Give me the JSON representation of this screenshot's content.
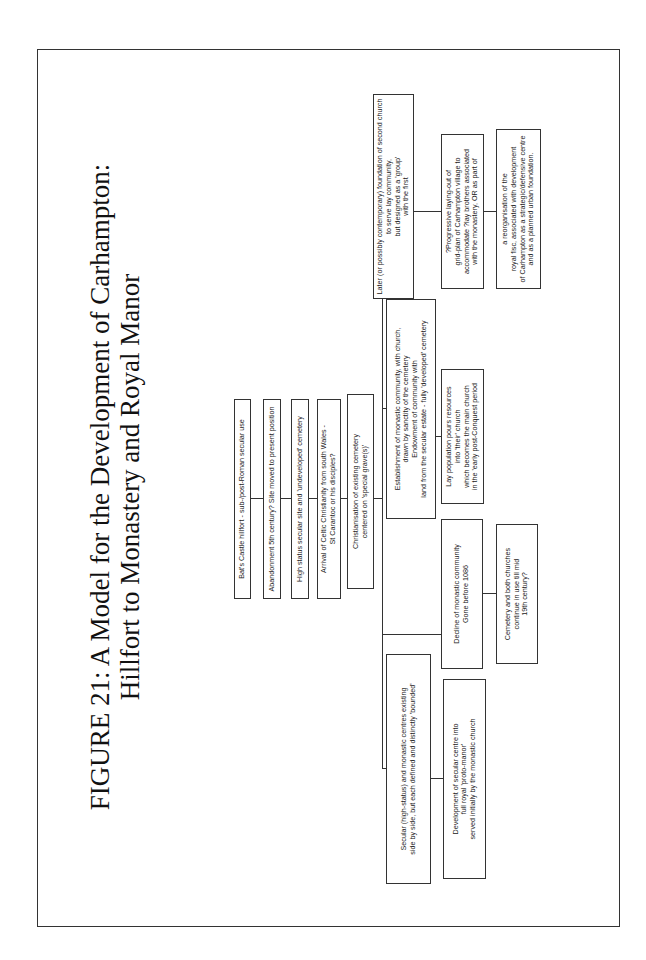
{
  "figure": {
    "title_line1": "FIGURE 21: A Model for the Development of Carhampton:",
    "title_line2": "Hillfort to Monastery and Royal Manor"
  },
  "chain": [
    {
      "text": "Bat's Castle hillfort - sub-/post-Roman secular use"
    },
    {
      "text": "Abandonment 5th century? Site moved to present position"
    },
    {
      "text": "High status secular site and 'undeveloped' cemetery"
    },
    {
      "text": "Arrival of Celtic Christianity from south Wales -\nSt Carantoc or his disciples?"
    },
    {
      "text": "Christianisation of existing cemetery\ncentered on 'special grave(s)'"
    }
  ],
  "branches": {
    "secular": {
      "text": "Secular (high-status) and monastic centres existing\nside by side, but each defined and distinctly 'bounded'",
      "child": "Development of secular centre into\nfull royal 'proto-manor'\nserved initially by the monastic church"
    },
    "decline": {
      "text": "Decline of monastic community\nGone before 1086",
      "child": "Cemetery and both churches\ncontinue in use till mid\n19th century?"
    },
    "monastic": {
      "text": "Establishment of monastic community, with church,\ndrawn by sanctity of the cemetery\nEndowment of community with\nland from the secular estate - fully 'developed' cemetery",
      "child": "Lay population pours resources\ninto 'their' church\nwhich becomes the main church\nin the 'early post-Conquest period"
    },
    "later": {
      "text": "Later (or possibly contemporary) foundation of second church\nto serve lay community,\nbut designed as a 'group'\nwith the first",
      "child": "?Progressive laying-out of\ngrid-plan of Carhampton village to\naccommodate ?lay brothers associated\nwith the monastery, OR as part of",
      "grandchild": "a reorganisation of the\nroyal fisc, associated with development\nof Carhampton as a strategic/defensive centre\nand as a planned urban foundation."
    }
  }
}
